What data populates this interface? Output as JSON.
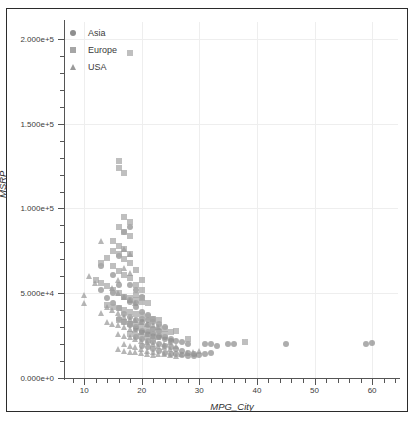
{
  "chart_data": {
    "type": "scatter",
    "title": "",
    "xlabel": "MPG_City",
    "ylabel": "MSRP",
    "xlim": [
      6.5,
      64.5
    ],
    "ylim": [
      0,
      210000
    ],
    "xticks": [
      10,
      20,
      30,
      40,
      50,
      60
    ],
    "xticklabels": [
      "10",
      "20",
      "30",
      "40",
      "50",
      "60"
    ],
    "yticks": [
      0,
      50000,
      100000,
      150000,
      200000
    ],
    "yticklabels": [
      "0.000e+0",
      "5.000e+4",
      "1.000e+5",
      "1.500e+5",
      "2.000e+5"
    ],
    "grid": true,
    "legend_position": "top-left",
    "minor_ticks": true,
    "series": [
      {
        "name": "Asia",
        "marker": "circle",
        "color": "#8e8e8e",
        "points": [
          [
            13,
            52000
          ],
          [
            14,
            47000
          ],
          [
            15,
            44000
          ],
          [
            16,
            41000
          ],
          [
            17,
            38000
          ],
          [
            18,
            36000
          ],
          [
            19,
            34000
          ],
          [
            17,
            86000
          ],
          [
            18,
            89000
          ],
          [
            16,
            72000
          ],
          [
            15,
            61000
          ],
          [
            13,
            66000
          ],
          [
            18,
            55000
          ],
          [
            19,
            52000
          ],
          [
            20,
            48000
          ],
          [
            18,
            45000
          ],
          [
            19,
            42000
          ],
          [
            20,
            39000
          ],
          [
            21,
            37000
          ],
          [
            22,
            35000
          ],
          [
            20,
            33000
          ],
          [
            21,
            31000
          ],
          [
            22,
            29000
          ],
          [
            23,
            28000
          ],
          [
            18,
            32000
          ],
          [
            19,
            30000
          ],
          [
            20,
            28000
          ],
          [
            21,
            27000
          ],
          [
            22,
            26000
          ],
          [
            23,
            25000
          ],
          [
            24,
            24000
          ],
          [
            25,
            23000
          ],
          [
            26,
            22000
          ],
          [
            27,
            21000
          ],
          [
            28,
            20000
          ],
          [
            19,
            24000
          ],
          [
            20,
            23000
          ],
          [
            21,
            22000
          ],
          [
            22,
            21000
          ],
          [
            23,
            20000
          ],
          [
            24,
            19000
          ],
          [
            25,
            18000
          ],
          [
            26,
            17000
          ],
          [
            27,
            16000
          ],
          [
            28,
            15000
          ],
          [
            29,
            14000
          ],
          [
            20,
            19000
          ],
          [
            21,
            18000
          ],
          [
            22,
            17000
          ],
          [
            23,
            16000
          ],
          [
            24,
            15000
          ],
          [
            25,
            14000
          ],
          [
            26,
            14000
          ],
          [
            27,
            13500
          ],
          [
            28,
            13000
          ],
          [
            29,
            13000
          ],
          [
            30,
            13500
          ],
          [
            31,
            14000
          ],
          [
            32,
            15000
          ],
          [
            33,
            19000
          ],
          [
            31,
            20000
          ],
          [
            32,
            20000
          ],
          [
            35,
            20000
          ],
          [
            36,
            20000
          ],
          [
            45,
            20000
          ],
          [
            59,
            20000
          ],
          [
            60,
            20500
          ],
          [
            16,
            35000
          ],
          [
            17,
            33000
          ],
          [
            18,
            31000
          ],
          [
            19,
            29000
          ],
          [
            20,
            27000
          ],
          [
            21,
            26000
          ],
          [
            22,
            25000
          ],
          [
            23,
            24000
          ],
          [
            24,
            23000
          ],
          [
            25,
            22000
          ],
          [
            17,
            48000
          ],
          [
            18,
            46000
          ],
          [
            19,
            44000
          ],
          [
            16,
            55000
          ],
          [
            15,
            50000
          ],
          [
            22,
            33000
          ],
          [
            23,
            32000
          ],
          [
            24,
            30000
          ],
          [
            20,
            35000
          ],
          [
            21,
            34000
          ]
        ]
      },
      {
        "name": "Europe",
        "marker": "square",
        "color": "#a6a6a6",
        "points": [
          [
            18,
            192000
          ],
          [
            16,
            128000
          ],
          [
            16,
            124000
          ],
          [
            17,
            121000
          ],
          [
            17,
            95000
          ],
          [
            18,
            92000
          ],
          [
            16,
            89000
          ],
          [
            17,
            86000
          ],
          [
            18,
            84000
          ],
          [
            15,
            81000
          ],
          [
            16,
            78000
          ],
          [
            17,
            76000
          ],
          [
            18,
            73000
          ],
          [
            14,
            71000
          ],
          [
            13,
            68000
          ],
          [
            15,
            66000
          ],
          [
            16,
            63000
          ],
          [
            17,
            61000
          ],
          [
            18,
            59000
          ],
          [
            12,
            58000
          ],
          [
            13,
            56000
          ],
          [
            14,
            54000
          ],
          [
            15,
            52000
          ],
          [
            16,
            50000
          ],
          [
            17,
            48000
          ],
          [
            18,
            47000
          ],
          [
            19,
            46000
          ],
          [
            20,
            45000
          ],
          [
            21,
            44000
          ],
          [
            14,
            43000
          ],
          [
            15,
            42000
          ],
          [
            16,
            41000
          ],
          [
            17,
            40000
          ],
          [
            18,
            39000
          ],
          [
            19,
            38000
          ],
          [
            20,
            37000
          ],
          [
            21,
            36000
          ],
          [
            22,
            35000
          ],
          [
            23,
            34000
          ],
          [
            16,
            34000
          ],
          [
            17,
            33000
          ],
          [
            18,
            32000
          ],
          [
            19,
            31000
          ],
          [
            20,
            30000
          ],
          [
            21,
            29000
          ],
          [
            22,
            28000
          ],
          [
            23,
            27000
          ],
          [
            24,
            26000
          ],
          [
            25,
            27000
          ],
          [
            18,
            26000
          ],
          [
            19,
            25000
          ],
          [
            20,
            24000
          ],
          [
            21,
            24000
          ],
          [
            22,
            23000
          ],
          [
            23,
            30000
          ],
          [
            24,
            29000
          ],
          [
            26,
            28000
          ],
          [
            38,
            21000
          ],
          [
            28,
            23000
          ],
          [
            19,
            64000
          ],
          [
            20,
            58000
          ],
          [
            19,
            55000
          ],
          [
            20,
            52000
          ],
          [
            18,
            68000
          ],
          [
            17,
            70000
          ],
          [
            16,
            73000
          ],
          [
            15,
            75000
          ],
          [
            19,
            49000
          ],
          [
            20,
            47000
          ]
        ]
      },
      {
        "name": "USA",
        "marker": "triangle",
        "color": "#9a9a9a",
        "points": [
          [
            13,
            81000
          ],
          [
            11,
            60000
          ],
          [
            12,
            56000
          ],
          [
            10,
            49000
          ],
          [
            10,
            44000
          ],
          [
            17,
            76000
          ],
          [
            18,
            73000
          ],
          [
            17,
            65000
          ],
          [
            18,
            62000
          ],
          [
            16,
            58000
          ],
          [
            15,
            53000
          ],
          [
            16,
            50000
          ],
          [
            17,
            48000
          ],
          [
            18,
            46000
          ],
          [
            19,
            44000
          ],
          [
            14,
            42000
          ],
          [
            15,
            40000
          ],
          [
            16,
            38000
          ],
          [
            17,
            36000
          ],
          [
            18,
            35000
          ],
          [
            19,
            34000
          ],
          [
            20,
            33000
          ],
          [
            21,
            32000
          ],
          [
            22,
            31000
          ],
          [
            23,
            30000
          ],
          [
            14,
            33000
          ],
          [
            15,
            32000
          ],
          [
            16,
            31000
          ],
          [
            17,
            30000
          ],
          [
            18,
            29000
          ],
          [
            19,
            28000
          ],
          [
            20,
            27000
          ],
          [
            21,
            26000
          ],
          [
            22,
            25000
          ],
          [
            23,
            24000
          ],
          [
            16,
            26000
          ],
          [
            17,
            25000
          ],
          [
            18,
            24000
          ],
          [
            19,
            23000
          ],
          [
            20,
            22000
          ],
          [
            21,
            21000
          ],
          [
            22,
            20000
          ],
          [
            23,
            19000
          ],
          [
            24,
            18000
          ],
          [
            25,
            17000
          ],
          [
            17,
            20000
          ],
          [
            18,
            19000
          ],
          [
            19,
            18000
          ],
          [
            20,
            17000
          ],
          [
            21,
            16000
          ],
          [
            22,
            15000
          ],
          [
            23,
            14000
          ],
          [
            24,
            14000
          ],
          [
            25,
            13500
          ],
          [
            26,
            13000
          ],
          [
            27,
            14000
          ],
          [
            28,
            14500
          ],
          [
            29,
            15000
          ],
          [
            30,
            16000
          ],
          [
            26,
            19000
          ],
          [
            16,
            17000
          ],
          [
            17,
            16000
          ],
          [
            18,
            15500
          ],
          [
            19,
            15000
          ],
          [
            20,
            14500
          ],
          [
            21,
            14000
          ],
          [
            22,
            13500
          ],
          [
            24,
            20000
          ],
          [
            25,
            21000
          ],
          [
            13,
            38000
          ]
        ]
      }
    ]
  },
  "legend": {
    "items": [
      {
        "label": "Asia",
        "marker": "circle-marker"
      },
      {
        "label": "Europe",
        "marker": "square-marker"
      },
      {
        "label": "USA",
        "marker": "triangle-marker"
      }
    ]
  }
}
